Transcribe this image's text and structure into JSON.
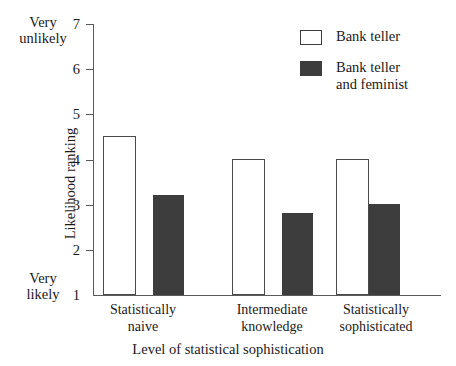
{
  "chart_data": {
    "type": "bar",
    "title": "",
    "xlabel": "Level of statistical sophistication",
    "ylabel": "Likelihood ranking",
    "categories": [
      "Statistically naive",
      "Intermediate knowledge",
      "Statistically sophisticated"
    ],
    "series": [
      {
        "name": "Bank teller",
        "values": [
          4.5,
          4.0,
          4.0
        ],
        "color": "#ffffff",
        "edge_color": "#4a4a4a"
      },
      {
        "name": "Bank teller and feminist",
        "values": [
          3.2,
          2.8,
          3.0
        ],
        "color": "#3d3d3d",
        "edge_color": "#2b2b2b"
      }
    ],
    "ylim": [
      1,
      7
    ],
    "yticks": [
      1,
      2,
      3,
      4,
      5,
      6,
      7
    ],
    "ytick_labels": [
      "1",
      "2",
      "3",
      "4",
      "5",
      "6",
      "7"
    ],
    "y_axis_high_anchor": "Very\nunlikely",
    "y_axis_low_anchor": "Very\nlikely",
    "grid": false,
    "legend_position": "top-right"
  },
  "axes": {
    "y_title": "Likelihood ranking",
    "x_title": "Level of statistical sophistication",
    "anchor_high_line1": "Very",
    "anchor_high_line2": "unlikely",
    "anchor_low_line1": "Very",
    "anchor_low_line2": "likely",
    "ticks": [
      {
        "label": "7",
        "value": 7
      },
      {
        "label": "6",
        "value": 6
      },
      {
        "label": "5",
        "value": 5
      },
      {
        "label": "4",
        "value": 4
      },
      {
        "label": "3",
        "value": 3
      },
      {
        "label": "2",
        "value": 2
      },
      {
        "label": "1",
        "value": 1
      }
    ]
  },
  "categories": [
    {
      "line1": "Statistically",
      "line2": "naive"
    },
    {
      "line1": "Intermediate",
      "line2": "knowledge"
    },
    {
      "line1": "Statistically",
      "line2": "sophisticated"
    }
  ],
  "legend": {
    "items": [
      {
        "label": "Bank teller",
        "style": "open"
      },
      {
        "label": "Bank teller\nand feminist",
        "style": "filled"
      }
    ]
  },
  "colors": {
    "filled_bar": "#3d3d3d",
    "open_bar_edge": "#4a4a4a",
    "axis": "#5a5a5a",
    "text": "#1a1a1a",
    "background": "#ffffff"
  }
}
